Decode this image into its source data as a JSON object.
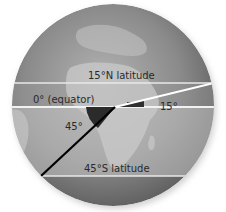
{
  "diagram": {
    "labels": {
      "lat_15n": "15°N latitude",
      "equator": "0° (equator)",
      "angle_15": "15°",
      "angle_45": "45°",
      "lat_45s": "45°S latitude"
    },
    "latitudes": [
      {
        "name": "15°N latitude",
        "degrees": 15,
        "hemisphere": "N"
      },
      {
        "name": "0° (equator)",
        "degrees": 0,
        "hemisphere": ""
      },
      {
        "name": "45°S latitude",
        "degrees": 45,
        "hemisphere": "S"
      }
    ],
    "angles": [
      {
        "label": "15°",
        "from": "equator",
        "to": "15°N radius",
        "color": "#ffffff"
      },
      {
        "label": "45°",
        "from": "equator",
        "to": "45°S radius",
        "color": "#000000"
      }
    ],
    "colors": {
      "globe_dark": "#6b6b6b",
      "globe_light": "#a8a8a8",
      "land": "#bdbdbd",
      "band_light": "#cfcfcf",
      "line_white": "#ffffff",
      "line_black": "#000000",
      "wedge": "#3a3a3a"
    }
  }
}
